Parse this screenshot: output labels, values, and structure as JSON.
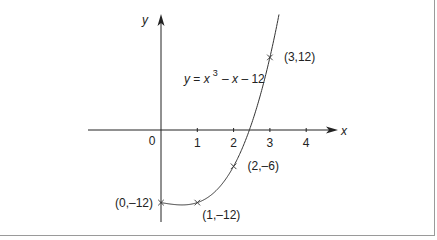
{
  "chart_data": {
    "type": "line",
    "title": "",
    "equation": {
      "y": "y",
      "eq": " = ",
      "x": "x",
      "exp": "3",
      "rest": "– x – 12"
    },
    "xlabel": "x",
    "ylabel": "y",
    "origin_label": "0",
    "xticks": [
      1,
      2,
      3,
      4
    ],
    "xtick_labels": [
      "1",
      "2",
      "3",
      "4"
    ],
    "xlim": [
      -2,
      4.8
    ],
    "ylim": [
      -16,
      20
    ],
    "grid": false,
    "function": "x^3 - x - 12",
    "curve_domain": [
      0,
      3.3
    ],
    "marked_points": [
      {
        "x": 0,
        "y": -12,
        "label": "(0,–12)",
        "pos": "left"
      },
      {
        "x": 1,
        "y": -12,
        "label": "(1,–12)",
        "pos": "below-right"
      },
      {
        "x": 2,
        "y": -6,
        "label": "(2,–6)",
        "pos": "right"
      },
      {
        "x": 3,
        "y": 12,
        "label": "(3,12)",
        "pos": "right"
      }
    ]
  }
}
